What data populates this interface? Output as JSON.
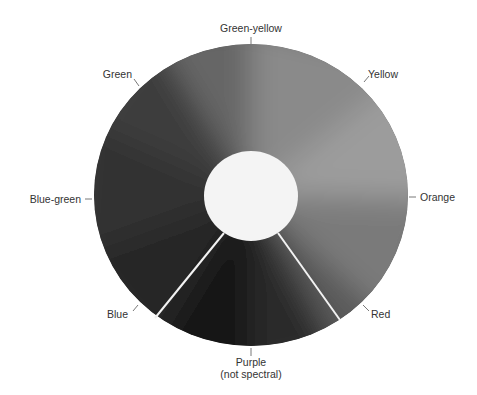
{
  "diagram": {
    "type": "color-wheel",
    "labels": {
      "green_yellow": "Green-yellow",
      "yellow": "Yellow",
      "orange": "Orange",
      "red": "Red",
      "purple_line1": "Purple",
      "purple_line2": "(not spectral)",
      "blue": "Blue",
      "blue_green": "Blue-green",
      "green": "Green"
    },
    "colors": {
      "background": "#ffffff",
      "label_text": "#333333",
      "center": "#f4f4f4",
      "divider": "#f2f2f2"
    }
  }
}
